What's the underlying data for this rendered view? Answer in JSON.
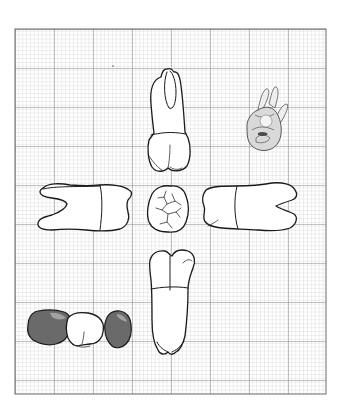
{
  "diagram": {
    "type": "dental-anatomy-sheet",
    "background": "#ffffff",
    "grid": {
      "left": 15,
      "top": 29,
      "right": 326,
      "bottom": 394,
      "minor_spacing": 3.9,
      "major_spacing": 39,
      "minor_color": "#bdbdbd",
      "major_color": "#7a7a7a",
      "border_color": "#6a6a6a"
    },
    "views": [
      {
        "id": "top",
        "label": "Tooth view (root up, two roots)"
      },
      {
        "id": "top-right",
        "label": "Shaded three-dimensional sketch"
      },
      {
        "id": "left",
        "label": "Tooth view (horizontal, roots left)"
      },
      {
        "id": "center",
        "label": "Occlusal view"
      },
      {
        "id": "right",
        "label": "Tooth view (horizontal, roots right)"
      },
      {
        "id": "bottom",
        "label": "Tooth view (root down)"
      },
      {
        "id": "bottom-left",
        "label": "Three-crown row (two shaded)"
      }
    ],
    "colors": {
      "outline": "#1a1a1a",
      "shaded_crown": "#6a6a6a",
      "sketch_fill": "#d9d9d9"
    }
  }
}
